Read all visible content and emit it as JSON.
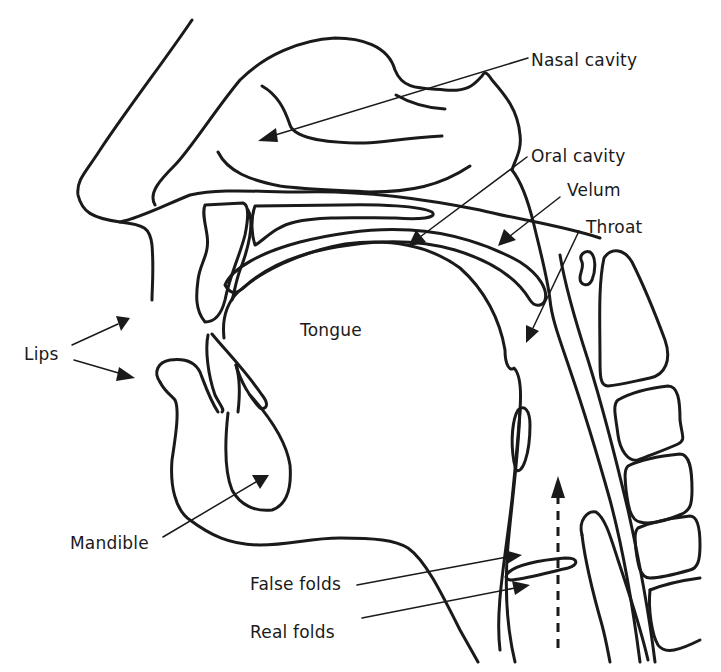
{
  "diagram": {
    "stroke_color": "#1a1a1a",
    "background_color": "#ffffff",
    "labels": [
      {
        "id": "nasal-cavity",
        "text": "Nasal cavity",
        "x": 531,
        "y": 52
      },
      {
        "id": "oral-cavity",
        "text": "Oral cavity",
        "x": 531,
        "y": 148
      },
      {
        "id": "velum",
        "text": "Velum",
        "x": 567,
        "y": 182
      },
      {
        "id": "throat",
        "text": "Throat",
        "x": 586,
        "y": 219
      },
      {
        "id": "tongue",
        "text": "Tongue",
        "x": 300,
        "y": 322
      },
      {
        "id": "lips",
        "text": "Lips",
        "x": 24,
        "y": 346
      },
      {
        "id": "mandible",
        "text": "Mandible",
        "x": 70,
        "y": 535
      },
      {
        "id": "false-folds",
        "text": "False folds",
        "x": 250,
        "y": 576
      },
      {
        "id": "real-folds",
        "text": "Real folds",
        "x": 250,
        "y": 624
      }
    ],
    "annotations": [
      {
        "label": "Nasal cavity",
        "from": [
          528,
          58
        ],
        "to": [
          260,
          140
        ]
      },
      {
        "label": "Oral cavity",
        "from": [
          527,
          157
        ],
        "to": [
          410,
          245
        ]
      },
      {
        "label": "Velum",
        "from": [
          560,
          197
        ],
        "to": [
          498,
          245
        ]
      },
      {
        "label": "Throat",
        "from": [
          579,
          231
        ],
        "to": [
          526,
          342
        ]
      },
      {
        "label": "Lips (upper)",
        "from": [
          72,
          345
        ],
        "to": [
          130,
          318
        ]
      },
      {
        "label": "Lips (lower)",
        "from": [
          74,
          360
        ],
        "to": [
          135,
          377
        ]
      },
      {
        "label": "Mandible",
        "from": [
          163,
          537
        ],
        "to": [
          269,
          475
        ]
      },
      {
        "label": "False folds",
        "from": [
          357,
          585
        ],
        "to": [
          520,
          555
        ]
      },
      {
        "label": "Real folds",
        "from": [
          362,
          618
        ],
        "to": [
          530,
          584
        ]
      }
    ],
    "airflow_arrow": {
      "style": "dashed",
      "direction": "up",
      "from": [
        558,
        648
      ],
      "to": [
        558,
        478
      ]
    }
  }
}
